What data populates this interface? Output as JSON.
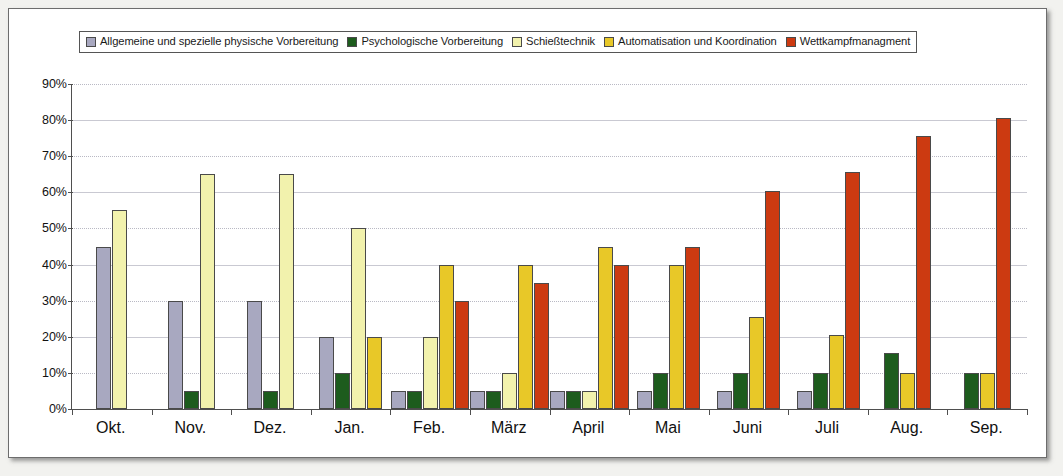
{
  "chart_data": {
    "type": "bar",
    "title": "",
    "xlabel": "",
    "ylabel": "",
    "ylim": [
      0,
      90
    ],
    "grid": true,
    "legend_position": "top",
    "ytick_labels": [
      "0%",
      "10%",
      "20%",
      "30%",
      "40%",
      "50%",
      "60%",
      "70%",
      "80%",
      "90%"
    ],
    "ytick_values": [
      0,
      10,
      20,
      30,
      40,
      50,
      60,
      70,
      80,
      90
    ],
    "categories": [
      "Okt.",
      "Nov.",
      "Dez.",
      "Jan.",
      "Feb.",
      "März",
      "April",
      "Mai",
      "Juni",
      "Juli",
      "Aug.",
      "Sep."
    ],
    "series": [
      {
        "name": "Allgemeine und spezielle physische Vorbereitung",
        "color": "#a8a8c0",
        "values": [
          45,
          30,
          30,
          20,
          5,
          5,
          5,
          5,
          5,
          5,
          0,
          0
        ]
      },
      {
        "name": "Psychologische Vorbereitung",
        "color": "#1d5c1d",
        "values": [
          0,
          5,
          5,
          10,
          5,
          5,
          5,
          10,
          10,
          10,
          15.5,
          10
        ]
      },
      {
        "name": "Schießtechnik",
        "color": "#f2f2ad",
        "values": [
          55,
          65,
          65,
          50,
          20,
          10,
          5,
          0,
          0,
          0,
          0,
          0
        ]
      },
      {
        "name": "Automatisation und Koordination",
        "color": "#e8c828",
        "values": [
          0,
          0,
          0,
          20,
          40,
          40,
          45,
          40,
          25.5,
          20.5,
          10,
          10
        ]
      },
      {
        "name": "Wettkampfmanagment",
        "color": "#cc3a11",
        "values": [
          0,
          0,
          0,
          0,
          30,
          35,
          40,
          45,
          60.5,
          65.5,
          75.5,
          80.5
        ]
      }
    ]
  }
}
